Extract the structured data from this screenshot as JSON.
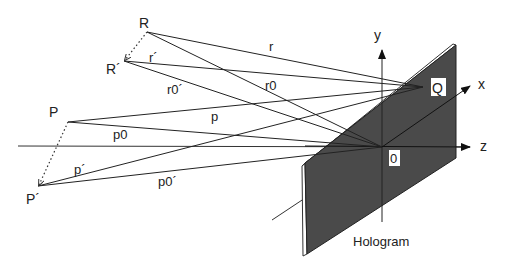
{
  "points": {
    "R": {
      "label": "R",
      "x": 147,
      "y": 32
    },
    "R_prime": {
      "label": "R´",
      "x": 124,
      "y": 61
    },
    "P": {
      "label": "P",
      "x": 68,
      "y": 122
    },
    "P_prime": {
      "label": "P´",
      "x": 38,
      "y": 186
    },
    "Q": {
      "label": "Q",
      "x": 423,
      "y": 87
    },
    "O": {
      "label": "0",
      "x": 382,
      "y": 147
    }
  },
  "rays": {
    "r": "r",
    "r_prime": "r´",
    "r0": "r0",
    "r0_prime": "r0´",
    "p": "p",
    "p_prime": "p´",
    "p0": "p0",
    "p0_prime": "p0´"
  },
  "axes": {
    "x": "x",
    "y": "y",
    "z": "z"
  },
  "plate_label": "Hologram",
  "colors": {
    "line": "#222222",
    "plate": "#4a4a4a",
    "plate_edge": "#ffffff"
  }
}
